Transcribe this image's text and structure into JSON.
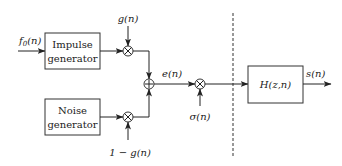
{
  "diagram": {
    "blocks": {
      "impulse": {
        "line1": "Impulse",
        "line2": "generator"
      },
      "noise": {
        "line1": "Noise",
        "line2": "generator"
      },
      "filter": {
        "label": "H(z,n)"
      }
    },
    "signals": {
      "input_base": "f",
      "input_sub": "0",
      "input_arg": "(n)",
      "gain_top": "g(n)",
      "gain_bottom": "1 − g(n)",
      "excitation": "e(n)",
      "amplitude": "σ(n)",
      "output": "s(n)"
    },
    "operators": {
      "multiply_symbol": "×",
      "add_symbol": "+"
    }
  }
}
